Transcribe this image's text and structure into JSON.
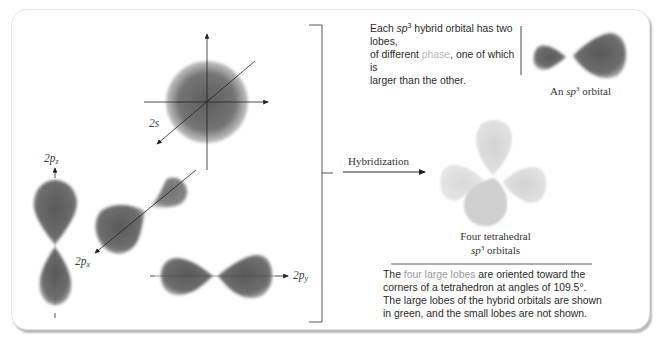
{
  "figure": {
    "orbital_labels": {
      "s": "2s",
      "pz_main": "2p",
      "pz_sub": "z",
      "px_main": "2p",
      "px_sub": "x",
      "py_main": "2p",
      "py_sub": "y"
    },
    "process_label": "Hybridization",
    "single_orbital_caption": {
      "prefix": "An ",
      "italic": "sp",
      "sup": "3",
      "suffix": " orbital"
    },
    "tetrahedral_caption": {
      "line1": "Four tetrahedral",
      "italic": "sp",
      "sup": "3",
      "suffix": " orbitals"
    },
    "top_note": {
      "part1": "Each ",
      "italic": "sp",
      "sup": "3",
      "part2": " hybrid orbital has two lobes,",
      "part3": "of different ",
      "highlight": "phase",
      "part4": ", one of which is",
      "part5": "larger than the other."
    },
    "bottom_note": {
      "part1": "The ",
      "highlight": "four large lobes",
      "part2": " are oriented toward the corners of a tetrahedron at angles of 109.5°. The large lobes of the hybrid orbitals are shown in green, and the small lobes are not shown."
    },
    "colors": {
      "orbital_fill": "#6a6a6a",
      "hybrid_fill": "#d8d8d8",
      "phase_highlight": "#b7b7b7",
      "lobes_highlight": "#9a9a9a",
      "axis": "#222222"
    }
  }
}
